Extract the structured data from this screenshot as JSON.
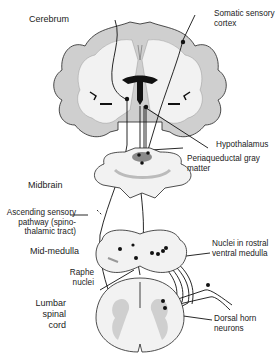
{
  "diagram": {
    "regions": {
      "cerebrum": "Cerebrum",
      "midbrain": "Midbrain",
      "mid_medulla": "Mid-medulla",
      "lumbar_l1": "Lumbar",
      "lumbar_l2": "spinal",
      "lumbar_l3": "cord"
    },
    "labels": {
      "somatic_l1": "Somatic sensory",
      "somatic_l2": "cortex",
      "hypothalamus": "Hypothalamus",
      "pag_l1": "Periaqueductal gray",
      "pag_l2": "matter",
      "ascending_l1": "Ascending sensory",
      "ascending_l2": "pathway (spino-",
      "ascending_l3": "thalamic tract)",
      "nuclei_l1": "Nuclei in rostral",
      "nuclei_l2": "ventral medulla",
      "raphe_l1": "Raphe",
      "raphe_l2": "nuclei",
      "dorsal_l1": "Dorsal horn",
      "dorsal_l2": "neurons"
    },
    "colors": {
      "white_matter": "#f2f2f2",
      "gray_matter": "#cfcfcf",
      "dark_gray": "#8a8a8a",
      "outline": "#222222",
      "text": "#222222"
    }
  }
}
